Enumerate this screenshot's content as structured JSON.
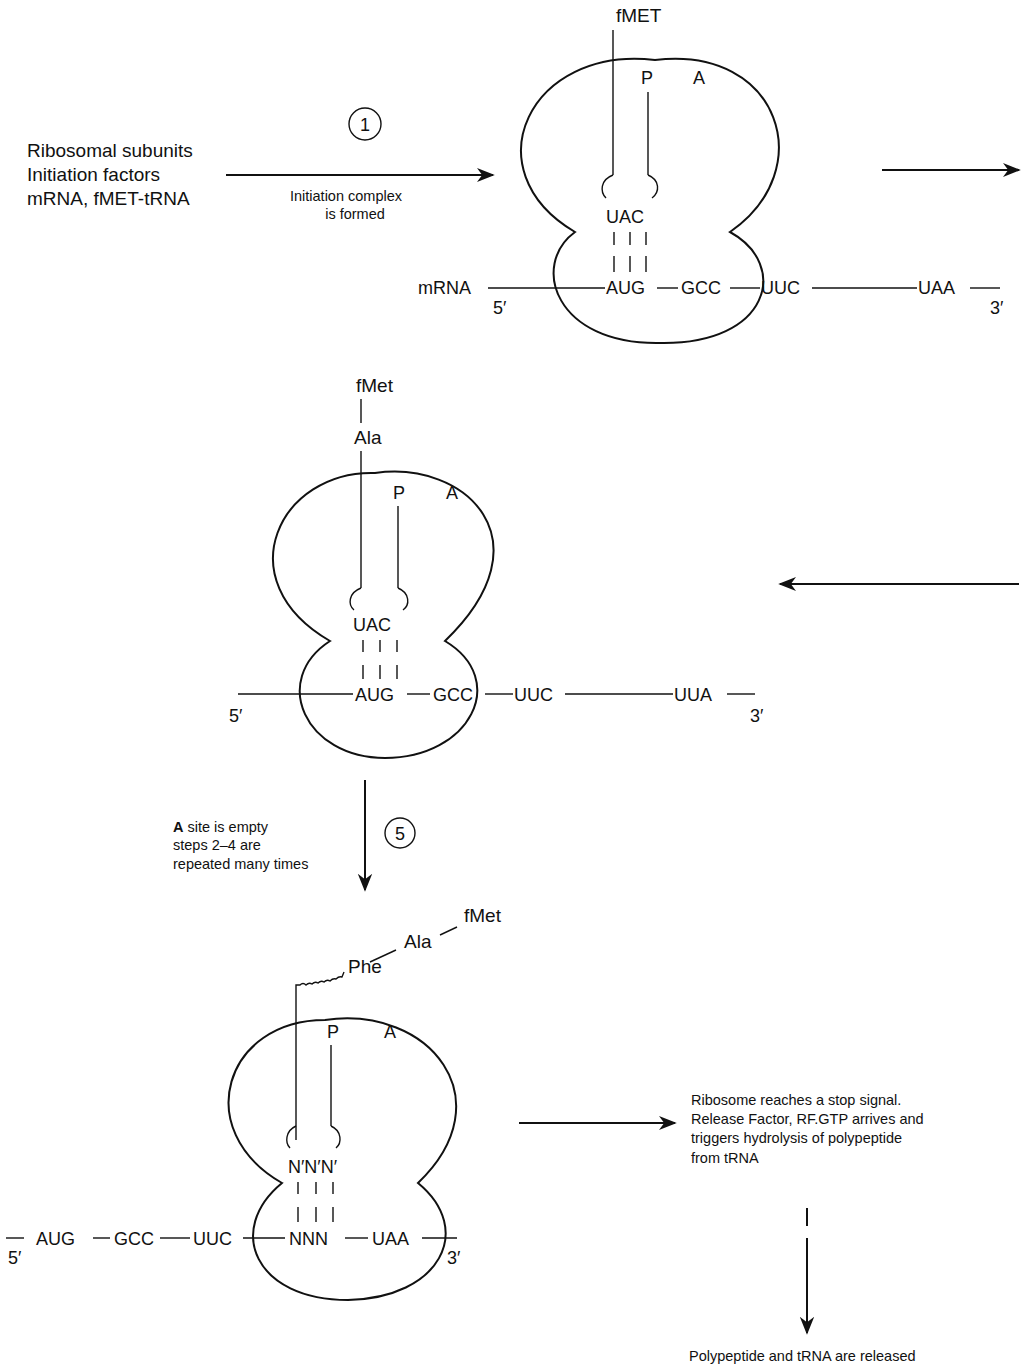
{
  "stage1": {
    "inputs": [
      "Ribosomal subunits",
      "Initiation factors",
      "mRNA, fMET-tRNA"
    ],
    "step_number": "1",
    "arrow_caption": [
      "Initiation complex",
      "is formed"
    ],
    "ribosome": {
      "peptide_label": "fMET",
      "site_p": "P",
      "site_a": "A",
      "anticodon": "UAC",
      "mrna_label": "mRNA",
      "five_prime": "5′",
      "three_prime": "3′",
      "codons": [
        "AUG",
        "GCC",
        "UUC",
        "UAA"
      ]
    }
  },
  "stage2": {
    "ribosome": {
      "peptide_chain": [
        "fMet",
        "Ala"
      ],
      "site_p": "P",
      "site_a": "A",
      "anticodon": "UAC",
      "five_prime": "5′",
      "three_prime": "3′",
      "codons": [
        "AUG",
        "GCC",
        "UUC",
        "UUA"
      ]
    }
  },
  "step5": {
    "step_number": "5",
    "caption_bold": "A",
    "caption_line1_rest": " site is empty",
    "caption_line2": "steps 2–4 are",
    "caption_line3": "repeated many times"
  },
  "stage3": {
    "ribosome": {
      "peptide_chain": [
        "fMet",
        "Ala",
        "Phe"
      ],
      "site_p": "P",
      "site_a": "A",
      "anticodon": "N′N′N′",
      "five_prime": "5′",
      "three_prime": "3′",
      "codons": [
        "AUG",
        "GCC",
        "UUC",
        "NNN",
        "UAA"
      ]
    }
  },
  "termination": {
    "caption": [
      "Ribosome reaches a stop signal.",
      "Release Factor, RF.GTP arrives and",
      "triggers hydrolysis of polypeptide",
      "from tRNA"
    ],
    "result": "Polypeptide and tRNA are released"
  }
}
